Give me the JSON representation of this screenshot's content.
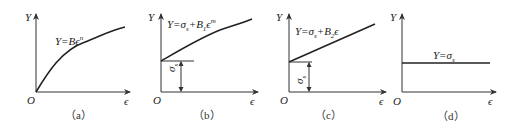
{
  "panels": [
    {
      "id": "a",
      "y_axis": "Y",
      "x_axis": "ϵ",
      "origin": "O",
      "formula": "Y=Bϵⁿ",
      "formula_parts": {
        "lhs": "Y=Bϵ",
        "sup": "n"
      },
      "caption": "（a）",
      "curve": "power"
    },
    {
      "id": "b",
      "y_axis": "Y",
      "x_axis": "ϵ",
      "origin": "O",
      "formula": "Y=σs+B1ϵm",
      "formula_parts": {
        "lhs": "Y=σ",
        "sub1": "s",
        "mid": "+B",
        "sub2": "1",
        "end": "ϵ",
        "sup": "m"
      },
      "intercept_label": "σs",
      "intercept_parts": {
        "sym": "σ",
        "sub": "s"
      },
      "caption": "（b）",
      "curve": "offset-power"
    },
    {
      "id": "c",
      "y_axis": "Y",
      "x_axis": "ϵ",
      "origin": "O",
      "formula": "Y=σs+B2ϵ",
      "formula_parts": {
        "lhs": "Y=σ",
        "sub1": "s",
        "mid": "+B",
        "sub2": "2",
        "end": "ϵ"
      },
      "intercept_label": "σs",
      "intercept_parts": {
        "sym": "σ",
        "sub": "s"
      },
      "caption": "（c）",
      "curve": "linear"
    },
    {
      "id": "d",
      "y_axis": "Y",
      "x_axis": "ϵ",
      "origin": "O",
      "formula": "Y=σs",
      "formula_parts": {
        "lhs": "Y=σ",
        "sub1": "s"
      },
      "caption": "（d）",
      "curve": "constant"
    }
  ],
  "colors": {
    "line": "#222222",
    "axis": "#333333"
  }
}
